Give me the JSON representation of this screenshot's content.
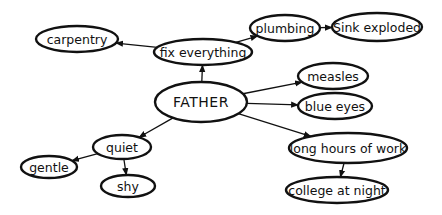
{
  "diagram": {
    "type": "mind-map",
    "center": {
      "id": "father",
      "label": "FATHER",
      "cx": 201,
      "cy": 102,
      "rx": 46,
      "ry": 20
    },
    "nodes": [
      {
        "id": "fix-everything",
        "label": "fix everything",
        "cx": 203,
        "cy": 52,
        "rx": 49,
        "ry": 13
      },
      {
        "id": "carpentry",
        "label": "carpentry",
        "cx": 77,
        "cy": 39,
        "rx": 41,
        "ry": 13
      },
      {
        "id": "plumbing",
        "label": "plumbing",
        "cx": 285,
        "cy": 28,
        "rx": 35,
        "ry": 13
      },
      {
        "id": "sink-exploded",
        "label": "Sink exploded",
        "cx": 377,
        "cy": 27,
        "rx": 45,
        "ry": 14
      },
      {
        "id": "measles",
        "label": "measles",
        "cx": 333,
        "cy": 76,
        "rx": 35,
        "ry": 13
      },
      {
        "id": "blue-eyes",
        "label": "blue eyes",
        "cx": 335,
        "cy": 106,
        "rx": 37,
        "ry": 13
      },
      {
        "id": "long-hours-of-work",
        "label": "long hours of work",
        "cx": 348,
        "cy": 148,
        "rx": 59,
        "ry": 15
      },
      {
        "id": "college-at-night",
        "label": "college at night",
        "cx": 337,
        "cy": 190,
        "rx": 51,
        "ry": 13
      },
      {
        "id": "quiet",
        "label": "quiet",
        "cx": 122,
        "cy": 147,
        "rx": 29,
        "ry": 12
      },
      {
        "id": "gentle",
        "label": "gentle",
        "cx": 49,
        "cy": 167,
        "rx": 28,
        "ry": 11
      },
      {
        "id": "shy",
        "label": "shy",
        "cx": 128,
        "cy": 186,
        "rx": 27,
        "ry": 11
      }
    ],
    "edges": [
      {
        "from": "father",
        "to": "fix-everything"
      },
      {
        "from": "fix-everything",
        "to": "carpentry"
      },
      {
        "from": "fix-everything",
        "to": "plumbing"
      },
      {
        "from": "plumbing",
        "to": "sink-exploded"
      },
      {
        "from": "father",
        "to": "measles"
      },
      {
        "from": "father",
        "to": "blue-eyes"
      },
      {
        "from": "father",
        "to": "long-hours-of-work"
      },
      {
        "from": "long-hours-of-work",
        "to": "college-at-night"
      },
      {
        "from": "father",
        "to": "quiet"
      },
      {
        "from": "quiet",
        "to": "gentle"
      },
      {
        "from": "quiet",
        "to": "shy"
      }
    ],
    "colors": {
      "stroke": "#111111",
      "background": "#ffffff",
      "fill": "#ffffff"
    }
  }
}
